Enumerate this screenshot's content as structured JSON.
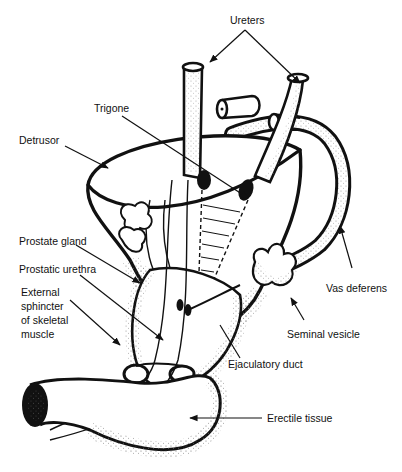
{
  "figure": {
    "labels": {
      "ureters": "Ureters",
      "trigone": "Trigone",
      "detrusor": "Detrusor",
      "prostate_gland": "Prostate gland",
      "prostatic_urethra": "Prostatic urethra",
      "external_sphincter_line1": "External",
      "external_sphincter_line2": "sphincter",
      "external_sphincter_line3": "of skeletal",
      "external_sphincter_line4": "muscle",
      "vas_deferens": "Vas deferens",
      "seminal_vesicle": "Seminal vesicle",
      "ejaculatory_duct": "Ejaculatory duct",
      "erectile_tissue": "Erectile tissue"
    },
    "colors": {
      "ink": "#111111",
      "background": "#ffffff",
      "stipple": "#555555"
    }
  }
}
